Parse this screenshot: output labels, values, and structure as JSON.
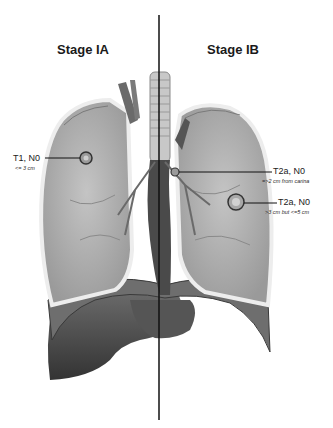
{
  "titles": {
    "left": "Stage IA",
    "right": "Stage IB"
  },
  "annotations": [
    {
      "id": "t1",
      "main": "T1, N0",
      "sub": "<= 3 cm",
      "side": "left"
    },
    {
      "id": "t2a-carina",
      "main": "T2a, N0",
      "sub": "=>2 cm from carina",
      "side": "right"
    },
    {
      "id": "t2a-size",
      "main": "T2a, N0",
      "sub": ">3 cm but <=5 cm",
      "side": "right"
    }
  ],
  "colors": {
    "lung_fill": "#b5b5b5",
    "lung_edge": "#e8e8e8",
    "diaphragm": "#5a5a5a",
    "liver": "#4a4a4a",
    "divider": "#111111"
  }
}
